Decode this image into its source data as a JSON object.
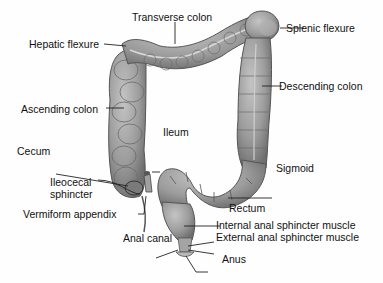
{
  "diagram": {
    "colors": {
      "tissue_fill": "#9a9a9a",
      "tissue_light": "#bdbdbd",
      "tissue_dark": "#6a6a6a",
      "outline": "#4a4a4a",
      "leader_line": "#222222",
      "text": "#111111"
    },
    "labels": {
      "transverse_colon": "Transverse colon",
      "hepatic_flexure": "Hepatic flexure",
      "splenic_flexure": "Splenic flexure",
      "ascending_colon": "Ascending colon",
      "descending_colon": "Descending colon",
      "ileum": "Ileum",
      "cecum": "Cecum",
      "ileocecal_sphincter_line1": "Ileocecal",
      "ileocecal_sphincter_line2": "sphincter",
      "sigmoid": "Sigmoid",
      "vermiform_appendix": "Vermiform appendix",
      "rectum": "Rectum",
      "internal_anal_sphincter": "Internal anal sphincter muscle",
      "external_anal_sphincter": "External anal sphincter muscle",
      "anal_canal": "Anal canal",
      "anus": "Anus"
    }
  }
}
